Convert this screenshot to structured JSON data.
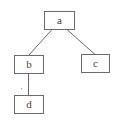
{
  "diagram": {
    "type": "tree",
    "nodes": [
      {
        "id": "a",
        "label": "a"
      },
      {
        "id": "b",
        "label": "b"
      },
      {
        "id": "c",
        "label": "c"
      },
      {
        "id": "d",
        "label": "d"
      }
    ],
    "edges": [
      {
        "from": "a",
        "to": "b"
      },
      {
        "from": "a",
        "to": "c"
      },
      {
        "from": "b",
        "to": "d"
      }
    ],
    "colors": {
      "stroke": "#6a6a6a",
      "text": "#444444",
      "background": "#ffffff"
    }
  }
}
